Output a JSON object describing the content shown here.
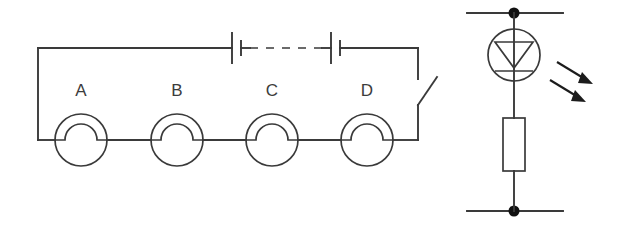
{
  "figure": {
    "name": "two-circuit-diagrams",
    "background_color": "#ffffff",
    "line_color": "#3a3a3a",
    "accent_color": "#1c1c1c",
    "width": 627,
    "height": 244
  },
  "left_circuit": {
    "name": "series-lamp-circuit",
    "lamps": [
      {
        "label": "A",
        "cx": 81,
        "cy": 140,
        "r": 26
      },
      {
        "label": "B",
        "cx": 177,
        "cy": 140,
        "r": 26
      },
      {
        "label": "C",
        "cx": 272,
        "cy": 140,
        "r": 26
      },
      {
        "label": "D",
        "cx": 367,
        "cy": 140,
        "r": 26
      }
    ],
    "battery_cells": [
      {
        "name": "battery-cell-left",
        "x": 232
      },
      {
        "name": "battery-cell-right",
        "x": 334
      }
    ],
    "dashed_gap": {
      "x1": 249,
      "x2": 323,
      "y": 48
    },
    "switch": {
      "name": "open-switch",
      "x": 418,
      "y_top": 79,
      "y_bottom": 105,
      "state": "open"
    },
    "top_wire": {
      "x1": 38,
      "x2": 418,
      "y": 48
    },
    "bottom_wire": {
      "x1": 38,
      "x2": 418,
      "y": 140
    }
  },
  "right_circuit": {
    "name": "photodiode-resistor-branch",
    "photodiode": {
      "name": "photodiode",
      "cx": 514,
      "cy": 55,
      "r": 26
    },
    "resistor": {
      "name": "resistor",
      "x": 503,
      "y": 118,
      "w": 22,
      "h": 53
    },
    "terminals": [
      {
        "name": "top-terminal-node",
        "cx": 514,
        "cy": 13,
        "r": 5.5,
        "x1": 467,
        "x2": 563
      },
      {
        "name": "bottom-terminal-node",
        "cx": 514,
        "cy": 211,
        "r": 5.5,
        "x1": 467,
        "x2": 563
      }
    ],
    "light_arrows": [
      {
        "name": "light-arrow-upper",
        "x1": 557,
        "y1": 62,
        "x2": 591,
        "y2": 82
      },
      {
        "name": "light-arrow-lower",
        "x1": 550,
        "y1": 80,
        "x2": 584,
        "y2": 100
      }
    ]
  }
}
